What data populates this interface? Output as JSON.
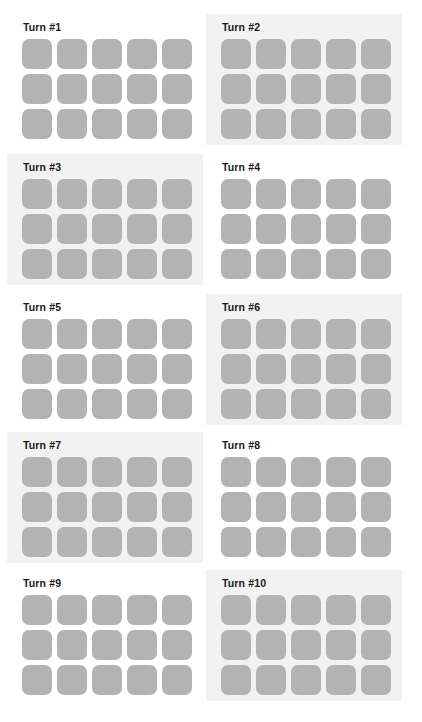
{
  "figure": {
    "width": 422,
    "height": 722,
    "background_color": "#ffffff",
    "layout": {
      "columns": 2,
      "rows": 5,
      "panel_count": 10
    }
  },
  "colors": {
    "tile_fill": "#b3b3b3",
    "panel_shaded_background": "#f2f2f2",
    "panel_plain_background": "#ffffff",
    "title_text": "#1a1a1a"
  },
  "grid_spec": {
    "tile_columns": 5,
    "tile_rows": 3,
    "tiles_per_panel": 15,
    "tile_size_px": 30,
    "tile_gap_px": 5,
    "tile_corner_radius_px": 7
  },
  "panels": [
    {
      "id": "turn-1",
      "title": "Turn #1",
      "shaded": false,
      "x": 7,
      "y": 14,
      "width": 196,
      "height": 131,
      "tiles": [
        [
          "#b3b3b3",
          "#b3b3b3",
          "#b3b3b3",
          "#b3b3b3",
          "#b3b3b3"
        ],
        [
          "#b3b3b3",
          "#b3b3b3",
          "#b3b3b3",
          "#b3b3b3",
          "#b3b3b3"
        ],
        [
          "#b3b3b3",
          "#b3b3b3",
          "#b3b3b3",
          "#b3b3b3",
          "#b3b3b3"
        ]
      ]
    },
    {
      "id": "turn-2",
      "title": "Turn #2",
      "shaded": true,
      "x": 206,
      "y": 14,
      "width": 196,
      "height": 131,
      "tiles": [
        [
          "#b3b3b3",
          "#b3b3b3",
          "#b3b3b3",
          "#b3b3b3",
          "#b3b3b3"
        ],
        [
          "#b3b3b3",
          "#b3b3b3",
          "#b3b3b3",
          "#b3b3b3",
          "#b3b3b3"
        ],
        [
          "#b3b3b3",
          "#b3b3b3",
          "#b3b3b3",
          "#b3b3b3",
          "#b3b3b3"
        ]
      ]
    },
    {
      "id": "turn-3",
      "title": "Turn #3",
      "shaded": true,
      "x": 7,
      "y": 154,
      "width": 196,
      "height": 131,
      "tiles": [
        [
          "#b3b3b3",
          "#b3b3b3",
          "#b3b3b3",
          "#b3b3b3",
          "#b3b3b3"
        ],
        [
          "#b3b3b3",
          "#b3b3b3",
          "#b3b3b3",
          "#b3b3b3",
          "#b3b3b3"
        ],
        [
          "#b3b3b3",
          "#b3b3b3",
          "#b3b3b3",
          "#b3b3b3",
          "#b3b3b3"
        ]
      ]
    },
    {
      "id": "turn-4",
      "title": "Turn #4",
      "shaded": false,
      "x": 206,
      "y": 154,
      "width": 196,
      "height": 131,
      "tiles": [
        [
          "#b3b3b3",
          "#b3b3b3",
          "#b3b3b3",
          "#b3b3b3",
          "#b3b3b3"
        ],
        [
          "#b3b3b3",
          "#b3b3b3",
          "#b3b3b3",
          "#b3b3b3",
          "#b3b3b3"
        ],
        [
          "#b3b3b3",
          "#b3b3b3",
          "#b3b3b3",
          "#b3b3b3",
          "#b3b3b3"
        ]
      ]
    },
    {
      "id": "turn-5",
      "title": "Turn #5",
      "shaded": false,
      "x": 7,
      "y": 294,
      "width": 196,
      "height": 131,
      "tiles": [
        [
          "#b3b3b3",
          "#b3b3b3",
          "#b3b3b3",
          "#b3b3b3",
          "#b3b3b3"
        ],
        [
          "#b3b3b3",
          "#b3b3b3",
          "#b3b3b3",
          "#b3b3b3",
          "#b3b3b3"
        ],
        [
          "#b3b3b3",
          "#b3b3b3",
          "#b3b3b3",
          "#b3b3b3",
          "#b3b3b3"
        ]
      ]
    },
    {
      "id": "turn-6",
      "title": "Turn #6",
      "shaded": true,
      "x": 206,
      "y": 294,
      "width": 196,
      "height": 131,
      "tiles": [
        [
          "#b3b3b3",
          "#b3b3b3",
          "#b3b3b3",
          "#b3b3b3",
          "#b3b3b3"
        ],
        [
          "#b3b3b3",
          "#b3b3b3",
          "#b3b3b3",
          "#b3b3b3",
          "#b3b3b3"
        ],
        [
          "#b3b3b3",
          "#b3b3b3",
          "#b3b3b3",
          "#b3b3b3",
          "#b3b3b3"
        ]
      ]
    },
    {
      "id": "turn-7",
      "title": "Turn #7",
      "shaded": true,
      "x": 7,
      "y": 432,
      "width": 196,
      "height": 131,
      "tiles": [
        [
          "#b3b3b3",
          "#b3b3b3",
          "#b3b3b3",
          "#b3b3b3",
          "#b3b3b3"
        ],
        [
          "#b3b3b3",
          "#b3b3b3",
          "#b3b3b3",
          "#b3b3b3",
          "#b3b3b3"
        ],
        [
          "#b3b3b3",
          "#b3b3b3",
          "#b3b3b3",
          "#b3b3b3",
          "#b3b3b3"
        ]
      ]
    },
    {
      "id": "turn-8",
      "title": "Turn #8",
      "shaded": false,
      "x": 206,
      "y": 432,
      "width": 196,
      "height": 131,
      "tiles": [
        [
          "#b3b3b3",
          "#b3b3b3",
          "#b3b3b3",
          "#b3b3b3",
          "#b3b3b3"
        ],
        [
          "#b3b3b3",
          "#b3b3b3",
          "#b3b3b3",
          "#b3b3b3",
          "#b3b3b3"
        ],
        [
          "#b3b3b3",
          "#b3b3b3",
          "#b3b3b3",
          "#b3b3b3",
          "#b3b3b3"
        ]
      ]
    },
    {
      "id": "turn-9",
      "title": "Turn #9",
      "shaded": false,
      "x": 7,
      "y": 570,
      "width": 196,
      "height": 131,
      "tiles": [
        [
          "#b3b3b3",
          "#b3b3b3",
          "#b3b3b3",
          "#b3b3b3",
          "#b3b3b3"
        ],
        [
          "#b3b3b3",
          "#b3b3b3",
          "#b3b3b3",
          "#b3b3b3",
          "#b3b3b3"
        ],
        [
          "#b3b3b3",
          "#b3b3b3",
          "#b3b3b3",
          "#b3b3b3",
          "#b3b3b3"
        ]
      ]
    },
    {
      "id": "turn-10",
      "title": "Turn #10",
      "shaded": true,
      "x": 206,
      "y": 570,
      "width": 196,
      "height": 131,
      "tiles": [
        [
          "#b3b3b3",
          "#b3b3b3",
          "#b3b3b3",
          "#b3b3b3",
          "#b3b3b3"
        ],
        [
          "#b3b3b3",
          "#b3b3b3",
          "#b3b3b3",
          "#b3b3b3",
          "#b3b3b3"
        ],
        [
          "#b3b3b3",
          "#b3b3b3",
          "#b3b3b3",
          "#b3b3b3",
          "#b3b3b3"
        ]
      ]
    }
  ]
}
